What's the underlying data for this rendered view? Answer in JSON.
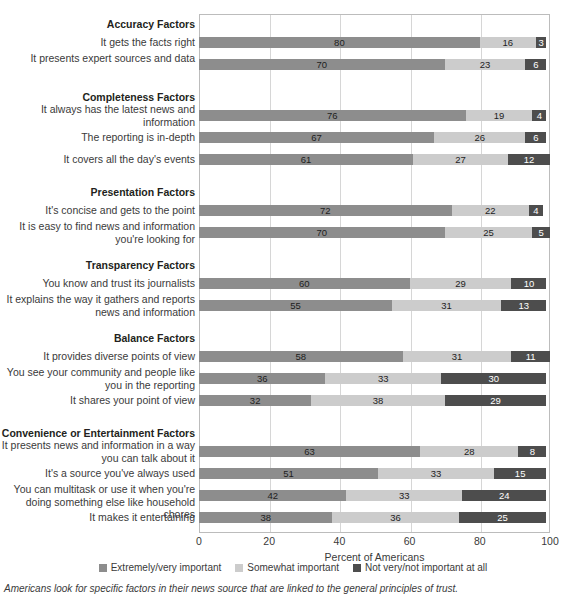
{
  "chart_data": {
    "type": "bar",
    "subtype": "stacked-horizontal-100",
    "title": "",
    "xlabel": "Percent of Americans",
    "ylabel": "",
    "xlim": [
      0,
      100
    ],
    "xticks": [
      0,
      20,
      40,
      60,
      80,
      100
    ],
    "grid": true,
    "legend_position": "bottom",
    "series": [
      {
        "name": "Extremely/very important",
        "color": "#8d8d8d"
      },
      {
        "name": "Somewhat important",
        "color": "#cccccc"
      },
      {
        "name": "Not very/not important at all",
        "color": "#4d4d4d"
      }
    ],
    "groups": [
      {
        "header": "Accuracy Factors",
        "rows": [
          {
            "label": "It gets the facts right",
            "values": [
              80,
              16,
              3
            ]
          },
          {
            "label": "It presents expert sources and data",
            "values": [
              70,
              23,
              6
            ]
          }
        ]
      },
      {
        "header": "Completeness Factors",
        "rows": [
          {
            "label": "It always has the latest news and information",
            "values": [
              76,
              19,
              4
            ]
          },
          {
            "label": "The reporting is in-depth",
            "values": [
              67,
              26,
              6
            ]
          },
          {
            "label": "It covers all the day's events",
            "values": [
              61,
              27,
              12
            ]
          }
        ]
      },
      {
        "header": "Presentation Factors",
        "rows": [
          {
            "label": "It's concise and gets to the point",
            "values": [
              72,
              22,
              4
            ]
          },
          {
            "label": "It is easy to find news and information you're looking for",
            "values": [
              70,
              25,
              5
            ]
          }
        ]
      },
      {
        "header": "Transparency Factors",
        "rows": [
          {
            "label": "You know and trust its journalists",
            "values": [
              60,
              29,
              10
            ]
          },
          {
            "label": "It explains the way it gathers and reports news and information",
            "values": [
              55,
              31,
              13
            ]
          }
        ]
      },
      {
        "header": "Balance Factors",
        "rows": [
          {
            "label": "It provides diverse points of view",
            "values": [
              58,
              31,
              11
            ]
          },
          {
            "label": "You see your community and people like you in the reporting",
            "values": [
              36,
              33,
              30
            ]
          },
          {
            "label": "It shares your point of view",
            "values": [
              32,
              38,
              29
            ]
          }
        ]
      },
      {
        "header": "Convenience or Entertainment Factors",
        "rows": [
          {
            "label": "It presents news and information in a way you can talk about it",
            "values": [
              63,
              28,
              8
            ]
          },
          {
            "label": "It's a source you've always used",
            "values": [
              51,
              33,
              15
            ]
          },
          {
            "label": "You can multitask or use it when you're doing something else like household chores",
            "values": [
              42,
              33,
              24
            ]
          },
          {
            "label": "It makes it entertaining",
            "values": [
              38,
              36,
              25
            ]
          }
        ]
      }
    ]
  },
  "footnote": "Americans look for specific factors in their news source that are linked to the general principles of trust."
}
